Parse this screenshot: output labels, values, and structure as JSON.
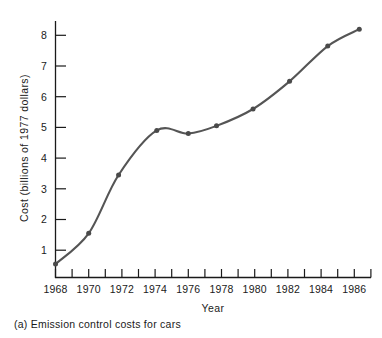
{
  "figure": {
    "caption": "(a) Emission control costs for cars",
    "line_color": "#555555",
    "marker_color": "#4a4a4a",
    "axis_color": "#1a1a1a",
    "background": "#ffffff"
  },
  "chart_data": {
    "type": "line",
    "title": "",
    "subtitle": "",
    "xlabel": "Year",
    "ylabel": "Cost (billions of 1977 dollars)",
    "xlim": [
      1968,
      1987
    ],
    "ylim": [
      0,
      8.5
    ],
    "grid": false,
    "legend": "none",
    "x_major_ticks": [
      1968,
      1970,
      1972,
      1974,
      1976,
      1978,
      1980,
      1982,
      1984,
      1986
    ],
    "x_minor_ticks": [
      1969,
      1971,
      1973,
      1975,
      1977,
      1979,
      1981,
      1983,
      1985,
      1987
    ],
    "x_tick_labels": [
      "1968",
      "1970",
      "1972",
      "1974",
      "1976",
      "1978",
      "1980",
      "1982",
      "1984",
      "1986"
    ],
    "y_ticks": [
      1,
      2,
      3,
      4,
      5,
      6,
      7,
      8
    ],
    "y_tick_labels": [
      "1",
      "2",
      "3",
      "4",
      "5",
      "6",
      "7",
      "8"
    ],
    "series": [
      {
        "name": "Emission control costs for cars",
        "x": [
          1968.0,
          1970.0,
          1971.8,
          1974.1,
          1976.0,
          1977.7,
          1979.9,
          1982.1,
          1984.4,
          1986.3
        ],
        "values": [
          0.55,
          1.55,
          3.45,
          4.9,
          4.8,
          5.05,
          5.6,
          6.5,
          7.65,
          8.2
        ],
        "marker": "dot",
        "smooth": true
      }
    ],
    "annotations": [
      "(a) Emission control costs for cars"
    ]
  }
}
